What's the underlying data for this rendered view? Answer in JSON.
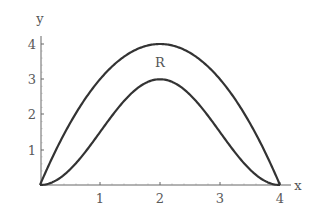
{
  "chart_data": {
    "type": "line",
    "title": "",
    "xlabel": "x",
    "ylabel": "y",
    "xlim": [
      0,
      4
    ],
    "ylim": [
      0,
      4
    ],
    "x_ticks": [
      "1",
      "2",
      "3",
      "4"
    ],
    "y_ticks": [
      "1",
      "2",
      "3",
      "4"
    ],
    "grid": false,
    "legend": null,
    "annotations": [
      {
        "text": "R",
        "x": 2,
        "y": 3.5
      }
    ],
    "x": [
      0,
      0.5,
      1,
      1.5,
      2,
      2.5,
      3,
      3.5,
      4
    ],
    "series": [
      {
        "name": "upper curve",
        "values": [
          0,
          1.75,
          3,
          3.75,
          4,
          3.75,
          3,
          1.75,
          0
        ]
      },
      {
        "name": "lower curve",
        "values": [
          0,
          0.44,
          1.5,
          2.56,
          3,
          2.56,
          1.5,
          0.44,
          0
        ]
      }
    ]
  },
  "labels": {
    "x_axis": "x",
    "y_axis": "y",
    "region": "R",
    "xt1": "1",
    "xt2": "2",
    "xt3": "3",
    "xt4": "4",
    "yt1": "1",
    "yt2": "2",
    "yt3": "3",
    "yt4": "4"
  },
  "colors": {
    "curve": "#333333",
    "axis": "#666666"
  }
}
